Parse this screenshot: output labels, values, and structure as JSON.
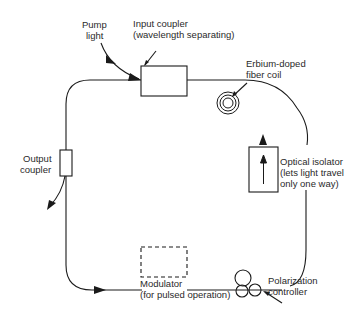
{
  "diagram": {
    "type": "fiber ring laser schematic",
    "labels": {
      "pump_light": [
        "Pump",
        "light"
      ],
      "input_coupler": [
        "Input coupler",
        "(wavelength separating)"
      ],
      "erbium_coil": [
        "Erbium-doped",
        "fiber coil"
      ],
      "optical_isolator": [
        "Optical isolator",
        "(lets light travel",
        "only one way)"
      ],
      "output_coupler": [
        "Output",
        "coupler"
      ],
      "modulator": [
        "Modulator",
        "(for pulsed operation)"
      ],
      "polarization_controller": [
        "Polarization",
        "controller"
      ]
    },
    "components": [
      {
        "id": "input-coupler",
        "shape": "box"
      },
      {
        "id": "erbium-doped-fiber-coil",
        "shape": "coil"
      },
      {
        "id": "optical-isolator",
        "shape": "box-with-arrow"
      },
      {
        "id": "polarization-controller",
        "shape": "loops"
      },
      {
        "id": "modulator",
        "shape": "dashed-box"
      },
      {
        "id": "output-coupler",
        "shape": "small-box"
      }
    ],
    "colors": {
      "line": "#1a1a1a",
      "text": "#2a2a2a",
      "background": "#ffffff"
    }
  }
}
